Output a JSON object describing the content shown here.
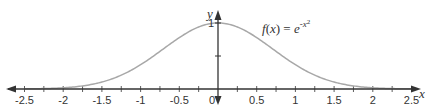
{
  "chart_data": {
    "type": "line",
    "title": "",
    "function": "f(x) = e^(-x^2)",
    "annotation": {
      "prefix_italic": "f",
      "paren_open": "(",
      "var": "x",
      "paren_close": ")",
      "equals": " = ",
      "base": "e",
      "exponent": "-x",
      "exponent_power": "2"
    },
    "xlabel": "x",
    "ylabel": "y",
    "xlim": [
      -2.5,
      2.5
    ],
    "ylim": [
      0,
      1
    ],
    "x_ticks": [
      -2.5,
      -2,
      -1.5,
      -1,
      -0.5,
      0,
      0.5,
      1,
      1.5,
      2,
      2.5
    ],
    "x_tick_labels": [
      "-2.5",
      "-2",
      "-1.5",
      "-1",
      "-0.5",
      "0",
      "0.5",
      "1",
      "1.5",
      "2",
      "2.5"
    ],
    "x_minor_tick_step": 0.25,
    "y_ticks": [
      0.5,
      1
    ],
    "y_tick_labels": [
      "",
      "1"
    ],
    "series": [
      {
        "name": "f(x) = e^(-x^2)",
        "x": [
          -2.5,
          -2.25,
          -2,
          -1.75,
          -1.5,
          -1.25,
          -1,
          -0.75,
          -0.5,
          -0.25,
          0,
          0.25,
          0.5,
          0.75,
          1,
          1.25,
          1.5,
          1.75,
          2,
          2.25,
          2.5
        ],
        "y": [
          0.0019,
          0.0063,
          0.0183,
          0.0468,
          0.1054,
          0.2096,
          0.3679,
          0.5698,
          0.7788,
          0.9394,
          1.0,
          0.9394,
          0.7788,
          0.5698,
          0.3679,
          0.2096,
          0.1054,
          0.0468,
          0.0183,
          0.0063,
          0.0019
        ]
      }
    ],
    "grid": false,
    "legend": "none",
    "colors": {
      "curve": "#a8a8a8",
      "axis": "#333333",
      "text": "#333333"
    }
  }
}
